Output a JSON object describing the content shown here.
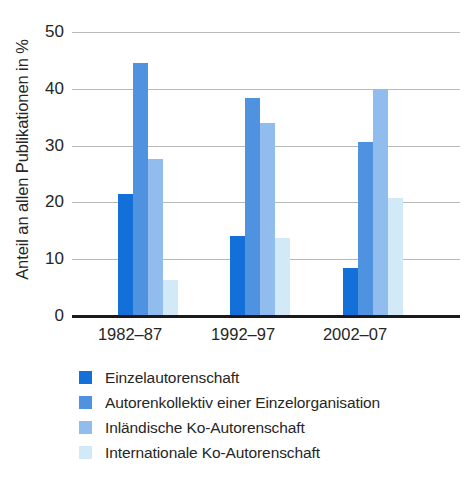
{
  "chart_data": {
    "type": "bar",
    "title": "",
    "subtitle": "",
    "xlabel": "",
    "ylabel": "Anteil an allen Publikationen in %",
    "categories": [
      "1982–87",
      "1992–97",
      "2002–07"
    ],
    "ylim": [
      0,
      50
    ],
    "yticks": [
      0,
      10,
      20,
      30,
      40,
      50
    ],
    "ytick_labels": [
      "0",
      "10",
      "20",
      "30",
      "40",
      "50"
    ],
    "grid": "horizontal",
    "legend_position": "below",
    "series": [
      {
        "name": "Einzelautorenschaft",
        "color": "#1270d8",
        "values": [
          21.4,
          14.0,
          8.5
        ]
      },
      {
        "name": "Autorenkollektiv einer Einzelorganisation",
        "color": "#4f93e0",
        "values": [
          44.6,
          38.3,
          30.7
        ]
      },
      {
        "name": "Inländische Ko-Autorenschaft",
        "color": "#90bcee",
        "values": [
          27.6,
          34.0,
          40.0
        ]
      },
      {
        "name": "Internationale Ko-Autorenschaft",
        "color": "#d2eaf8",
        "values": [
          6.4,
          13.7,
          20.7
        ]
      }
    ]
  },
  "axis": {
    "y_title": "Anteil an allen Publikationen in %",
    "tick_0": "0",
    "tick_10": "10",
    "tick_20": "20",
    "tick_30": "30",
    "tick_40": "40",
    "tick_50": "50"
  },
  "xaxis": {
    "cat_0": "1982–87",
    "cat_1": "1992–97",
    "cat_2": "2002–07"
  },
  "legend": {
    "item_0": "Einzelautorenschaft",
    "item_1": "Autorenkollektiv einer Einzelorganisation",
    "item_2": "Inländische Ko-Autorenschaft",
    "item_3": "Internationale Ko-Autorenschaft"
  },
  "colors": {
    "series_1": "#1270d8",
    "series_2": "#4f93e0",
    "series_3": "#90bcee",
    "series_4": "#d2eaf8",
    "gridline": "#b9b9b9",
    "axis": "#1a1a1a",
    "text": "#262626",
    "background": "#ffffff"
  }
}
